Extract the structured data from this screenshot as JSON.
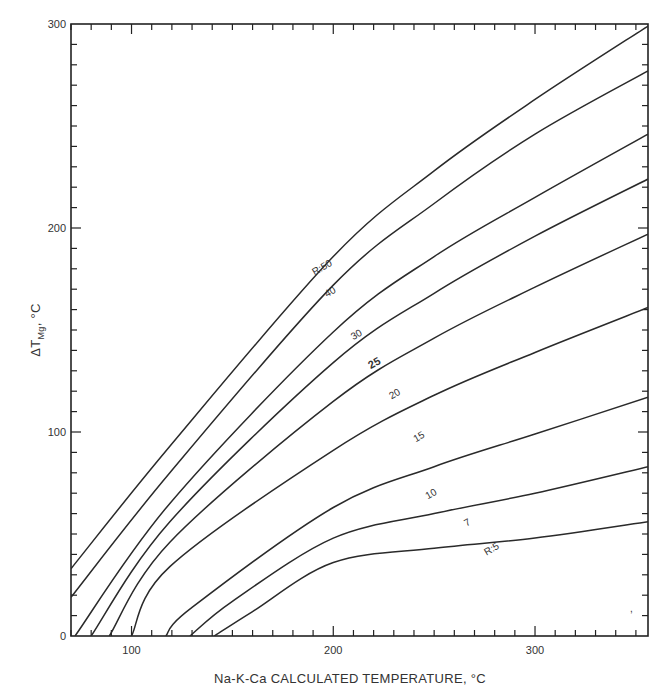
{
  "chart_data": {
    "type": "line",
    "title": "",
    "xlabel": "Na-K-Ca CALCULATED TEMPERATURE, °C",
    "ylabel": "ΔT",
    "ylabel_sub": "Mg",
    "ylabel_unit": ", °C",
    "xlim": [
      70,
      356
    ],
    "ylim": [
      0,
      300
    ],
    "x_ticks": [
      100,
      200,
      300
    ],
    "y_ticks": [
      0,
      100,
      200,
      300
    ],
    "x_minor_step": 10,
    "y_minor_step": 10,
    "grid": false,
    "legend": "inline curve labels",
    "series": [
      {
        "name": "R=50",
        "label": "R:50",
        "label_at": [
          196,
          178
        ],
        "points": [
          [
            70,
            33
          ],
          [
            119,
            93
          ],
          [
            200,
            186
          ],
          [
            250,
            228
          ],
          [
            300,
            263
          ],
          [
            356,
            299
          ]
        ]
      },
      {
        "name": "R=40",
        "label": "40",
        "label_at": [
          200,
          166
        ],
        "points": [
          [
            70,
            19
          ],
          [
            119,
            80
          ],
          [
            200,
            172
          ],
          [
            250,
            212
          ],
          [
            300,
            246
          ],
          [
            356,
            277
          ]
        ]
      },
      {
        "name": "R=30",
        "label": "30",
        "label_at": [
          213,
          145
        ],
        "points": [
          [
            72,
            0
          ],
          [
            119,
            65
          ],
          [
            200,
            149
          ],
          [
            250,
            186
          ],
          [
            300,
            215
          ],
          [
            356,
            246
          ]
        ]
      },
      {
        "name": "R=25",
        "label": "25",
        "label_at": [
          222,
          131
        ],
        "bold": true,
        "points": [
          [
            80,
            0
          ],
          [
            119,
            56
          ],
          [
            200,
            134
          ],
          [
            250,
            168
          ],
          [
            300,
            196
          ],
          [
            356,
            224
          ]
        ]
      },
      {
        "name": "R=20",
        "label": "20",
        "label_at": [
          232,
          116
        ],
        "points": [
          [
            89,
            0
          ],
          [
            119,
            46
          ],
          [
            200,
            115
          ],
          [
            250,
            146
          ],
          [
            300,
            171
          ],
          [
            356,
            197
          ]
        ]
      },
      {
        "name": "R=15",
        "label": "15",
        "label_at": [
          244,
          95
        ],
        "points": [
          [
            100,
            0
          ],
          [
            119,
            34
          ],
          [
            200,
            91
          ],
          [
            250,
            118
          ],
          [
            300,
            139
          ],
          [
            356,
            161
          ]
        ]
      },
      {
        "name": "R=10",
        "label": "10",
        "label_at": [
          250,
          67
        ],
        "points": [
          [
            117,
            0
          ],
          [
            130,
            14
          ],
          [
            200,
            63
          ],
          [
            250,
            83
          ],
          [
            300,
            99
          ],
          [
            356,
            117
          ]
        ]
      },
      {
        "name": "R=7",
        "label": "7",
        "label_at": [
          268,
          53
        ],
        "points": [
          [
            129,
            0
          ],
          [
            150,
            17
          ],
          [
            200,
            48
          ],
          [
            250,
            60
          ],
          [
            300,
            70
          ],
          [
            356,
            83
          ]
        ]
      },
      {
        "name": "R=5",
        "label": "R:5",
        "label_at": [
          280,
          40
        ],
        "points": [
          [
            141,
            0
          ],
          [
            160,
            12
          ],
          [
            200,
            36
          ],
          [
            250,
            43
          ],
          [
            300,
            48
          ],
          [
            356,
            56
          ]
        ]
      }
    ]
  },
  "axes": {
    "x_tick_labels": [
      "100",
      "200",
      "300"
    ],
    "y_tick_labels": [
      "0",
      "100",
      "200",
      "300"
    ]
  },
  "style": {
    "line_color": "#2a2a2a",
    "axis_color": "#222222",
    "background": "#ffffff"
  }
}
